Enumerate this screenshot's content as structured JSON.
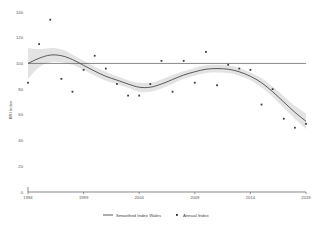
{
  "chart_data": {
    "type": "line",
    "title": "",
    "subtitle": "",
    "xlabel": "",
    "ylabel": "BRI Index",
    "xlim": [
      1994,
      2019
    ],
    "ylim": [
      0,
      140
    ],
    "grid": false,
    "legend_position": "bottom",
    "x_ticks": [
      "1994",
      "1999",
      "2004",
      "2009",
      "2014",
      "2019"
    ],
    "x_tick_values": [
      1994,
      1999,
      2004,
      2009,
      2014,
      2019
    ],
    "y_ticks": [
      "0",
      "20",
      "40",
      "60",
      "80",
      "100",
      "120",
      "140"
    ],
    "y_tick_values": [
      0,
      20,
      40,
      60,
      80,
      100,
      120,
      140
    ],
    "reference_line": {
      "value": 100,
      "orientation": "horizontal"
    },
    "series": [
      {
        "name": "Smoothed Index Wales",
        "type": "line",
        "x": [
          1994,
          1995,
          1996,
          1997,
          1998,
          1999,
          2000,
          2001,
          2002,
          2003,
          2004,
          2005,
          2006,
          2007,
          2008,
          2009,
          2010,
          2011,
          2012,
          2013,
          2014,
          2015,
          2016,
          2017,
          2018,
          2019
        ],
        "values": [
          100,
          104,
          106.5,
          106,
          103,
          98.5,
          94,
          90,
          87,
          84,
          81.5,
          81.5,
          84,
          87.5,
          91,
          93.5,
          95.5,
          96,
          95.5,
          93.5,
          90,
          85,
          78,
          70,
          62,
          55
        ]
      },
      {
        "name": "Annual Index",
        "type": "scatter",
        "x": [
          1994,
          1995,
          1996,
          1997,
          1998,
          1999,
          2000,
          2001,
          2002,
          2003,
          2004,
          2005,
          2006,
          2007,
          2008,
          2009,
          2010,
          2011,
          2012,
          2013,
          2014,
          2015,
          2016,
          2017,
          2018,
          2019
        ],
        "values": [
          85,
          115,
          134,
          88,
          78,
          95,
          106,
          96,
          84,
          75,
          75,
          84,
          102,
          78,
          102,
          85,
          109,
          83,
          99,
          96,
          95,
          68,
          80,
          57,
          50,
          53
        ]
      }
    ],
    "confidence_band": {
      "name": "Smoothed Index confidence interval",
      "x": [
        1994,
        1995,
        1996,
        1997,
        1998,
        1999,
        2000,
        2001,
        2002,
        2003,
        2004,
        2005,
        2006,
        2007,
        2008,
        2009,
        2010,
        2011,
        2012,
        2013,
        2014,
        2015,
        2016,
        2017,
        2018,
        2019
      ],
      "upper": [
        112,
        111,
        112,
        111,
        107,
        102,
        97.5,
        93.5,
        90,
        87,
        85,
        85,
        87.5,
        91,
        94,
        96.5,
        98.5,
        99,
        98.5,
        96.5,
        93,
        88.5,
        82,
        74.5,
        67,
        61
      ],
      "lower": [
        88,
        97,
        101,
        101,
        99,
        95,
        90.5,
        86.5,
        84,
        81,
        78,
        78,
        80.5,
        84,
        88,
        90.5,
        92.5,
        93,
        92.5,
        90.5,
        87,
        81.5,
        74,
        65.5,
        57,
        49
      ]
    },
    "colors": {
      "line": "#4a4a4a",
      "marker": "#3c3c3c",
      "band": "#d9d9d9",
      "reference_line": "#555555",
      "axis": "#555555",
      "background": "#ffffff"
    }
  },
  "legend": {
    "entries": [
      {
        "label": "Smoothed Index Wales",
        "marker": "line"
      },
      {
        "label": "Annual Index",
        "marker": "square"
      }
    ]
  }
}
